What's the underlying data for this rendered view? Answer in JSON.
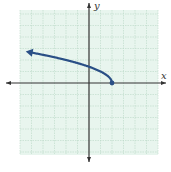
{
  "chart_data": {
    "type": "line",
    "title": "",
    "xlabel": "x",
    "ylabel": "y",
    "xlim": [
      -6,
      6
    ],
    "ylim": [
      -6,
      6
    ],
    "grid": true,
    "grid_step": 1,
    "function": "y = sqrt(2 - x)",
    "series": [
      {
        "name": "curve",
        "color": "#2a4f86",
        "endpoint": {
          "x": 2,
          "y": 0,
          "closed": true
        },
        "arrow_end": {
          "x": -5.5,
          "y": 2.74
        },
        "points": [
          {
            "x": 2,
            "y": 0
          },
          {
            "x": 1.75,
            "y": 0.5
          },
          {
            "x": 1,
            "y": 1
          },
          {
            "x": 0,
            "y": 1.41
          },
          {
            "x": -1,
            "y": 1.73
          },
          {
            "x": -2,
            "y": 2
          },
          {
            "x": -3,
            "y": 2.24
          },
          {
            "x": -4,
            "y": 2.45
          },
          {
            "x": -5,
            "y": 2.65
          },
          {
            "x": -5.5,
            "y": 2.74
          }
        ]
      }
    ]
  },
  "labels": {
    "x_axis": "x",
    "y_axis": "y"
  },
  "colors": {
    "grid_fill": "#e8f5ee",
    "grid_line": "#b9d8c6",
    "axis": "#333333",
    "curve": "#2a4f86"
  }
}
